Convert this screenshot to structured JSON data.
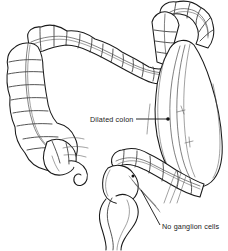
{
  "figure": {
    "background_color": "#ffffff",
    "line_color": "#1a1a1a",
    "width": 228,
    "height": 251
  },
  "labels": [
    {
      "id": "dilated-colon",
      "text": "Dilated colon",
      "x": 90,
      "y": 122,
      "leader": {
        "from_x": 136,
        "from_y": 119,
        "to_x": 167,
        "to_y": 119,
        "dot_x": 168,
        "dot_y": 119,
        "dot_r": 1.8
      }
    },
    {
      "id": "no-ganglion-cells",
      "text": "No ganglion cells",
      "x": 162,
      "y": 229,
      "leader": {
        "from_x": 160,
        "from_y": 225,
        "to_x": 141,
        "to_y": 190,
        "dot_x": 141,
        "dot_y": 190,
        "dot_r": 0
      }
    }
  ],
  "anatomy_parts": [
    {
      "id": "transverse-colon",
      "name": "Transverse colon",
      "has_haustra": true
    },
    {
      "id": "descending-colon",
      "name": "Descending colon",
      "has_haustra": true
    },
    {
      "id": "cecum",
      "name": "Cecum",
      "has_haustra": true
    },
    {
      "id": "appendix",
      "name": "Appendix",
      "has_haustra": false
    },
    {
      "id": "ascending-colon",
      "name": "Ascending colon",
      "has_haustra": true
    },
    {
      "id": "dilated-colon-sac",
      "name": "Dilated colon",
      "has_haustra": false
    },
    {
      "id": "sigmoid-colon",
      "name": "Sigmoid colon",
      "has_haustra": true
    },
    {
      "id": "aganglionic-segment",
      "name": "Narrow aganglionic segment",
      "has_haustra": false
    }
  ]
}
